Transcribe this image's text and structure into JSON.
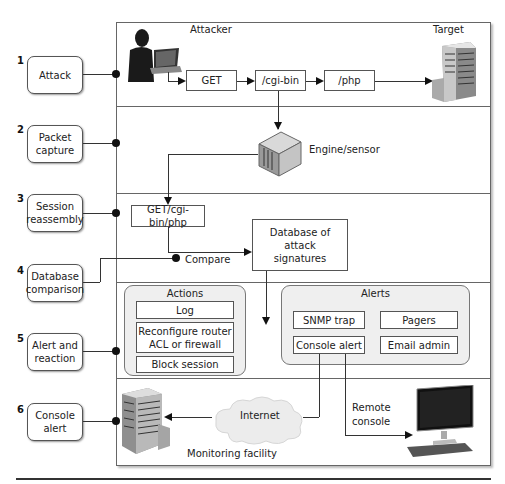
{
  "diagram": {
    "steps": [
      {
        "number": "1",
        "label": "Attack"
      },
      {
        "number": "2",
        "label": "Packet capture"
      },
      {
        "number": "3",
        "label": "Session reassembly"
      },
      {
        "number": "4",
        "label": "Database comparison"
      },
      {
        "number": "5",
        "label": "Alert and reaction"
      },
      {
        "number": "6",
        "label": "Console alert"
      }
    ],
    "attack_row": {
      "attacker_label": "Attacker",
      "target_label": "Target",
      "request_parts": [
        "GET",
        "/cgi-bin",
        "/php"
      ]
    },
    "capture_row": {
      "sensor_label": "Engine/sensor"
    },
    "reassembly_row": {
      "reassembled_request": "GET/cgi-bin/php",
      "compare_label": "Compare",
      "database_label": "Database of attack signatures"
    },
    "reaction_row": {
      "actions": {
        "title": "Actions",
        "items": [
          "Log",
          "Reconfigure router ACL or firewall",
          "Block session"
        ]
      },
      "alerts": {
        "title": "Alerts",
        "items": [
          "SNMP trap",
          "Pagers",
          "Console alert",
          "Email admin"
        ]
      }
    },
    "console_row": {
      "internet_label": "Internet",
      "facility_label": "Monitoring facility",
      "remote_console_label": "Remote console"
    }
  }
}
